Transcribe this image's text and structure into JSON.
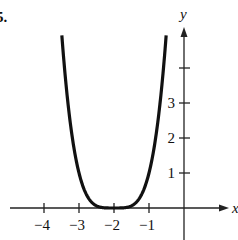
{
  "problem_label": "5.",
  "chart_data": {
    "type": "line",
    "title": "",
    "function": "y = (x + 2)^4",
    "xlabel": "x",
    "ylabel": "y",
    "xlim": [
      -4.5,
      1.3
    ],
    "ylim": [
      -0.6,
      5.5
    ],
    "x_ticks": [
      -4,
      -3,
      -2,
      -1
    ],
    "x_tick_labels": [
      "−4",
      "−3",
      "−2",
      "−1"
    ],
    "y_ticks": [
      1,
      2,
      3,
      4
    ],
    "y_tick_labels": [
      "1",
      "2",
      "3",
      ""
    ],
    "grid": false,
    "legend": null,
    "series": [
      {
        "name": "curve",
        "x": [
          -3.49,
          -3.25,
          -3.0,
          -2.75,
          -2.5,
          -2.25,
          -2.0,
          -1.75,
          -1.5,
          -1.25,
          -1.0,
          -0.75,
          -0.51
        ],
        "y": [
          4.93,
          2.44,
          1.0,
          0.32,
          0.06,
          0.004,
          0.0,
          0.004,
          0.06,
          0.32,
          1.0,
          2.44,
          4.93
        ]
      }
    ],
    "colors": {
      "curve": "#111111",
      "axes": "#222222"
    }
  }
}
